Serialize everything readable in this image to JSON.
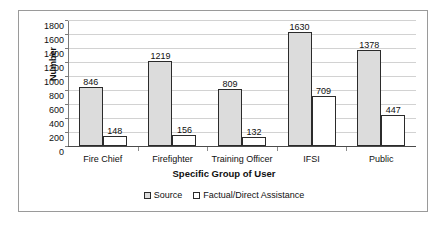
{
  "chart_data": {
    "type": "bar",
    "title": "",
    "subtitle": "",
    "xlabel": "Specific Group of User",
    "ylabel": "Number",
    "categories": [
      "Fire Chief",
      "Firefighter",
      "Training Officer",
      "IFSI",
      "Public"
    ],
    "series": [
      {
        "name": "Source",
        "values": [
          846,
          1219,
          809,
          1630,
          1378
        ],
        "color": "#dcdcdc"
      },
      {
        "name": "Factual/Direct Assistance",
        "values": [
          148,
          156,
          132,
          709,
          447
        ],
        "color": "#ffffff"
      }
    ],
    "ylim": [
      0,
      1800
    ],
    "ytick_step": 200,
    "yticks": [
      0,
      200,
      400,
      600,
      800,
      1000,
      1200,
      1400,
      1600,
      1800
    ],
    "grid": true,
    "grid_axis": "y",
    "legend_position": "bottom",
    "data_labels": true,
    "bar_border_color": "#2b2b2b",
    "gridline_color": "#d2d2d2",
    "frame_color": "#9a9a9a",
    "background_color": "#ffffff"
  },
  "legend": {
    "items": [
      {
        "label": "Source",
        "swatch": "series-source"
      },
      {
        "label": "Factual/Direct Assistance",
        "swatch": "series-factual"
      }
    ]
  }
}
